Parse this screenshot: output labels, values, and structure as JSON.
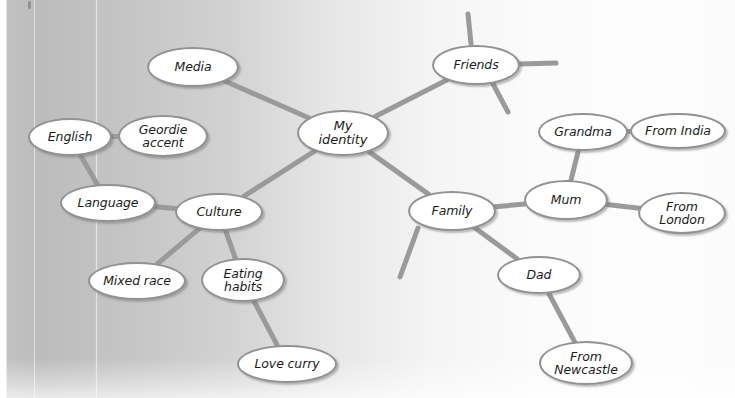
{
  "diagram": {
    "type": "mind-map",
    "title": "My identity",
    "medium": "hand-drawn / scanned worksheet mind map",
    "page_background": {
      "left_tone": "#bcbcbc",
      "right_tone": "#fdfdfd"
    },
    "style": {
      "node_fill": "#ffffff",
      "node_stroke": "#929292",
      "link_stroke": "#9a9a9a",
      "text_color": "#1c1c1c"
    },
    "nodes": [
      {
        "id": "identity",
        "label": "My\nidentity",
        "x": 297,
        "y": 110,
        "w": 92,
        "h": 46,
        "role": "central"
      },
      {
        "id": "media",
        "label": "Media",
        "x": 147,
        "y": 47,
        "w": 92,
        "h": 40,
        "role": "branch"
      },
      {
        "id": "friends",
        "label": "Friends",
        "x": 432,
        "y": 45,
        "w": 88,
        "h": 40,
        "role": "branch"
      },
      {
        "id": "culture",
        "label": "Culture",
        "x": 175,
        "y": 193,
        "w": 88,
        "h": 38,
        "role": "branch"
      },
      {
        "id": "family",
        "label": "Family",
        "x": 408,
        "y": 191,
        "w": 88,
        "h": 40,
        "role": "branch"
      },
      {
        "id": "english",
        "label": "English",
        "x": 28,
        "y": 118,
        "w": 84,
        "h": 38,
        "role": "leaf"
      },
      {
        "id": "geordie",
        "label": "Geordie\naccent",
        "x": 118,
        "y": 115,
        "w": 90,
        "h": 42,
        "role": "leaf"
      },
      {
        "id": "language",
        "label": "Language",
        "x": 60,
        "y": 184,
        "w": 96,
        "h": 38,
        "role": "leaf"
      },
      {
        "id": "mixedrace",
        "label": "Mixed race",
        "x": 88,
        "y": 262,
        "w": 98,
        "h": 38,
        "role": "leaf"
      },
      {
        "id": "eating",
        "label": "Eating\nhabits",
        "x": 201,
        "y": 258,
        "w": 84,
        "h": 44,
        "role": "leaf"
      },
      {
        "id": "lovecurry",
        "label": "Love curry",
        "x": 237,
        "y": 345,
        "w": 100,
        "h": 38,
        "role": "leaf"
      },
      {
        "id": "mum",
        "label": "Mum",
        "x": 524,
        "y": 180,
        "w": 84,
        "h": 40,
        "role": "leaf"
      },
      {
        "id": "grandma",
        "label": "Grandma",
        "x": 538,
        "y": 113,
        "w": 90,
        "h": 38,
        "role": "leaf"
      },
      {
        "id": "fromindia",
        "label": "From India",
        "x": 630,
        "y": 113,
        "w": 96,
        "h": 36,
        "role": "leaf"
      },
      {
        "id": "fromlondon",
        "label": "From\nLondon",
        "x": 638,
        "y": 192,
        "w": 88,
        "h": 42,
        "role": "leaf"
      },
      {
        "id": "dad",
        "label": "Dad",
        "x": 497,
        "y": 256,
        "w": 84,
        "h": 38,
        "role": "leaf"
      },
      {
        "id": "fromnewc",
        "label": "From\nNewcastle",
        "x": 539,
        "y": 341,
        "w": 94,
        "h": 44,
        "role": "leaf"
      }
    ],
    "links": [
      {
        "from": "identity",
        "to": "media"
      },
      {
        "from": "identity",
        "to": "friends"
      },
      {
        "from": "identity",
        "to": "culture"
      },
      {
        "from": "identity",
        "to": "family"
      },
      {
        "from": "culture",
        "to": "language"
      },
      {
        "from": "culture",
        "to": "mixedrace"
      },
      {
        "from": "culture",
        "to": "eating"
      },
      {
        "from": "language",
        "to": "english"
      },
      {
        "from": "english",
        "to": "geordie"
      },
      {
        "from": "eating",
        "to": "lovecurry"
      },
      {
        "from": "family",
        "to": "mum"
      },
      {
        "from": "family",
        "to": "dad"
      },
      {
        "from": "mum",
        "to": "grandma"
      },
      {
        "from": "mum",
        "to": "fromlondon"
      },
      {
        "from": "grandma",
        "to": "fromindia"
      },
      {
        "from": "dad",
        "to": "fromnewc"
      }
    ],
    "empty_stubs": [
      {
        "from": "friends",
        "x1": 471,
        "y1": 44,
        "x2": 468,
        "y2": 14,
        "note": "blank branch above Friends"
      },
      {
        "from": "friends",
        "x1": 520,
        "y1": 64,
        "x2": 556,
        "y2": 63,
        "note": "blank branch right of Friends"
      },
      {
        "from": "friends",
        "x1": 492,
        "y1": 82,
        "x2": 508,
        "y2": 112,
        "note": "blank branch below-right of Friends"
      },
      {
        "from": "family",
        "x1": 418,
        "y1": 228,
        "x2": 400,
        "y2": 277,
        "note": "blank branch below-left of Family"
      }
    ]
  }
}
